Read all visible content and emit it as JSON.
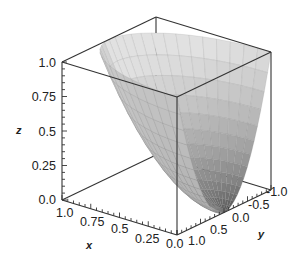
{
  "chart_data": {
    "type": "surface3d",
    "title": "",
    "surface": "z = x^2 + y^2 (elliptic paraboloid), clipped to box",
    "axes": {
      "x": {
        "label": "x",
        "range": [
          0.0,
          1.0
        ],
        "ticks": [
          "1.0",
          "0.75",
          "0.5",
          "0.25",
          "0.0"
        ]
      },
      "y": {
        "label": "y",
        "range": [
          -1.0,
          1.0
        ],
        "ticks": [
          "1.0",
          "0.5",
          "0.0",
          "-0.5",
          "-1.0"
        ]
      },
      "z": {
        "label": "z",
        "range": [
          0.0,
          1.0
        ],
        "ticks": [
          "1.0",
          "0.75",
          "0.5",
          "0.25",
          "0.0"
        ]
      }
    },
    "box": true,
    "grid": false,
    "mesh": true,
    "shading": "grayscale",
    "legend": null
  },
  "colors": {
    "surface_light": "#d8d8d8",
    "surface_dark": "#3a3a3a",
    "box": "#333333",
    "text": "#222222"
  }
}
